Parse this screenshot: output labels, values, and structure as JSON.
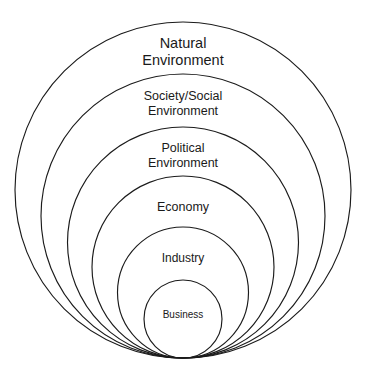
{
  "diagram": {
    "type": "nested-concentric-circles",
    "title": "",
    "background_color": "#ffffff",
    "stroke_color": "#1b1b1b",
    "text_color": "#1a1a1a",
    "bottom_tangent_y": 358,
    "center_x": 183,
    "rings": [
      {
        "id": "natural-environment",
        "label": "Natural Environment",
        "label_lines": [
          "Natural",
          "Environment"
        ],
        "level": 1,
        "top_y": 22,
        "diameter": 336,
        "radius": 168,
        "center_y": 190,
        "label_y": 44,
        "font_size": 14.5,
        "line_height": 16.5
      },
      {
        "id": "society-social-environment",
        "label": "Society/Social Environment",
        "label_lines": [
          "Society/Social",
          "Environment"
        ],
        "level": 2,
        "top_y": 74,
        "diameter": 284,
        "radius": 142,
        "center_y": 216,
        "label_y": 97,
        "font_size": 12.5,
        "line_height": 14.5
      },
      {
        "id": "political-environment",
        "label": "Political Environment",
        "label_lines": [
          "Political",
          "Environment"
        ],
        "level": 3,
        "top_y": 127,
        "diameter": 231,
        "radius": 115.5,
        "center_y": 242.5,
        "label_y": 149,
        "font_size": 12.5,
        "line_height": 14.5
      },
      {
        "id": "economy",
        "label": "Economy",
        "label_lines": [
          "Economy"
        ],
        "level": 4,
        "top_y": 176,
        "diameter": 182,
        "radius": 91,
        "center_y": 267,
        "label_y": 208,
        "font_size": 12.5,
        "line_height": 14.5
      },
      {
        "id": "industry",
        "label": "Industry",
        "label_lines": [
          "Industry"
        ],
        "level": 5,
        "top_y": 227,
        "diameter": 131,
        "radius": 65.5,
        "center_y": 292.5,
        "label_y": 259,
        "font_size": 12,
        "line_height": 14
      },
      {
        "id": "business",
        "label": "Business",
        "label_lines": [
          "Business"
        ],
        "level": 6,
        "top_y": 280,
        "diameter": 78,
        "radius": 39,
        "center_y": 319,
        "label_y": 315,
        "font_size": 10,
        "line_height": 12
      }
    ]
  }
}
